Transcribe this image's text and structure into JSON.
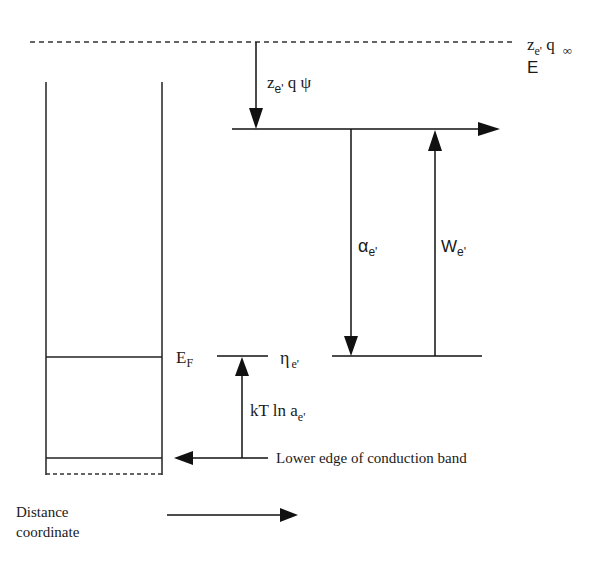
{
  "diagram": {
    "labels": {
      "vacuum_level": {
        "main": "z",
        "sub": "e'",
        "rest": " q",
        "sub2": "∞",
        "line2": "E"
      },
      "surface_potential": {
        "main": "z",
        "sub": "e'",
        "rest": " q ψ"
      },
      "chemical_potential": {
        "main": "α",
        "sub": "e'"
      },
      "work_function": {
        "main": "W",
        "sub": "e'"
      },
      "fermi_level": {
        "main": "E",
        "sub": "F"
      },
      "electrochemical_potential": {
        "main": "η",
        "sub": "e'"
      },
      "activity_term": {
        "main": "kT ln a",
        "sub": "e'"
      },
      "conduction_band": "Lower edge of conduction band",
      "distance_axis_line1": "Distance",
      "distance_axis_line2": "coordinate"
    }
  }
}
